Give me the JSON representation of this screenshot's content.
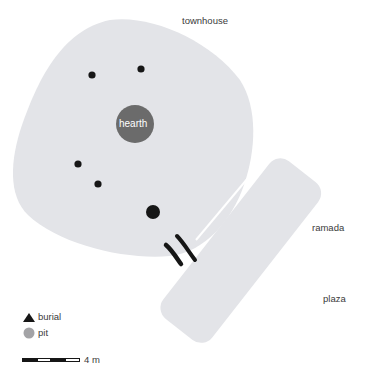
{
  "diagram": {
    "type": "archaeological site plan",
    "features": {
      "townhouse": {
        "label": "townhouse",
        "fill": "#e3e4e8"
      },
      "ramada": {
        "label": "ramada",
        "fill": "#e3e4e8"
      },
      "plaza": {
        "label": "plaza"
      },
      "hearth": {
        "label": "hearth",
        "fill": "#6b6b6b",
        "text_color": "#ffffff"
      }
    },
    "postholes_color": "#161616",
    "legend": {
      "items": [
        {
          "symbol": "triangle",
          "label": "burial",
          "color": "#161616"
        },
        {
          "symbol": "circle",
          "label": "pit",
          "color": "#a3a3a6"
        }
      ]
    },
    "scale_bar": {
      "label": "4 m"
    }
  }
}
